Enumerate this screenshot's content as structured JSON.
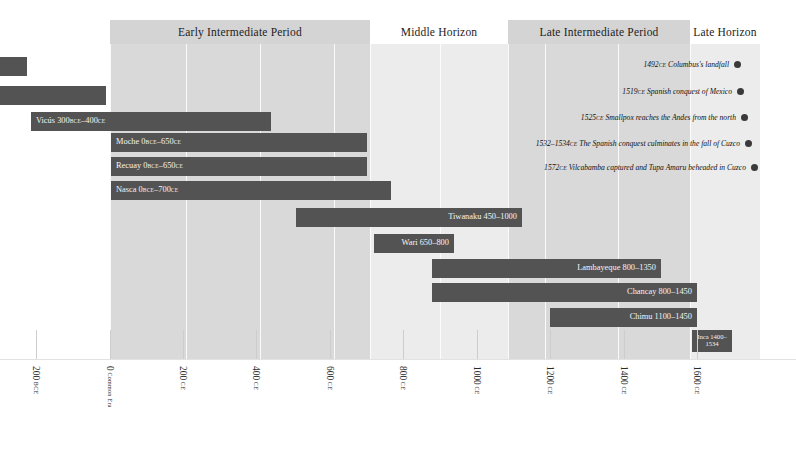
{
  "chart_data": {
    "type": "bar",
    "xlabel": "",
    "ylabel": "",
    "xlim": [
      -300,
      1650
    ],
    "grid": true,
    "legend": false,
    "orientation": "horizontal-gantt",
    "categories": [
      "",
      "",
      "Vicús",
      "Moche",
      "Recuay",
      "Nasca",
      "Tiwanaku",
      "Wari",
      "Lambayeque",
      "Chancay",
      "Chimu",
      "Inca"
    ],
    "series": [
      {
        "name": "cultures",
        "values": [
          {
            "label": "",
            "start": -300,
            "end": -230
          },
          {
            "label": "",
            "start": -300,
            "end": -10
          },
          {
            "label": "Vicús  300BCE–400CE",
            "start": -230,
            "end": 400
          },
          {
            "label": "Moche  0BCE–650CE",
            "start": 0,
            "end": 650
          },
          {
            "label": "Recuay  0BCE–650CE",
            "start": 0,
            "end": 650
          },
          {
            "label": "Nasca  0BCE–700CE",
            "start": 0,
            "end": 700
          },
          {
            "label": "Tiwanaku 450–1000",
            "start": 450,
            "end": 1000
          },
          {
            "label": "Wari 650–800",
            "start": 650,
            "end": 800
          },
          {
            "label": "Lambayeque 800–1350",
            "start": 800,
            "end": 1350
          },
          {
            "label": "Chancay 800–1450",
            "start": 800,
            "end": 1450
          },
          {
            "label": "Chimu 1100–1450",
            "start": 1100,
            "end": 1450
          },
          {
            "label": "Inca 1400–1534",
            "start": 1400,
            "end": 1534
          }
        ]
      }
    ],
    "annotations": [
      {
        "year": 1492,
        "text": "1492CE Columbus's landfall"
      },
      {
        "year": 1519,
        "text": "1519CE Spanish conquest of Mexico"
      },
      {
        "year": 1525,
        "text": "1525CE Smallpox reaches the Andes from the north"
      },
      {
        "year": 1533,
        "text": "1532–1534CE The Spanish conquest culminates in the fall of Cuzco"
      },
      {
        "year": 1572,
        "text": "1572CE Vilcabamba captured and Tupa Amaru beheaded in Cuzco"
      }
    ],
    "tick_values": [
      -200,
      0,
      200,
      400,
      600,
      800,
      1000,
      1200,
      1400,
      1600
    ],
    "tick_labels": [
      "200 BCE",
      "0 Common Era",
      "200 CE",
      "400 CE",
      "600 CE",
      "800 CE",
      "1000 CE",
      "1200 CE",
      "1400 CE",
      "1600 CE"
    ]
  },
  "colors": {
    "bar": "#535353",
    "band_shaded": "#d9d9d9",
    "band_light": "#ececec",
    "band_plain": "#f2f2f2",
    "header_shaded": "#d4d4d4",
    "dot": "#3a3a3a",
    "bar_text": "#f3f3f3"
  },
  "periods": [
    {
      "name": "Early Intermediate Period",
      "x": 110,
      "w": 260,
      "style": "shaded"
    },
    {
      "name": "Middle Horizon",
      "x": 370,
      "w": 138,
      "style": "plain"
    },
    {
      "name": "Late Intermediate Period",
      "x": 508,
      "w": 182,
      "style": "shaded"
    },
    {
      "name": "Late Horizon",
      "x": 690,
      "w": 70,
      "style": "plain"
    }
  ],
  "bars": [
    {
      "name": "bar-row-1",
      "label": "",
      "x": 0,
      "w": 27,
      "y": 57,
      "align": "lft",
      "lines": 1
    },
    {
      "name": "bar-row-2",
      "label": "",
      "x": 0,
      "w": 106,
      "y": 86,
      "align": "lft",
      "lines": 1
    },
    {
      "name": "bar-vicus",
      "label": "Vicús  300BCE–400CE",
      "x": 31,
      "w": 240,
      "y": 112,
      "align": "lft",
      "lines": 1
    },
    {
      "name": "bar-moche",
      "label": "Moche  0BCE–650CE",
      "x": 111,
      "w": 256,
      "y": 133,
      "align": "lft",
      "lines": 1
    },
    {
      "name": "bar-recuay",
      "label": "Recuay  0BCE–650CE",
      "x": 111,
      "w": 256,
      "y": 157,
      "align": "lft",
      "lines": 1
    },
    {
      "name": "bar-nasca",
      "label": "Nasca  0BCE–700CE",
      "x": 111,
      "w": 280,
      "y": 181,
      "align": "lft",
      "lines": 1
    },
    {
      "name": "bar-tiwanaku",
      "label": "Tiwanaku 450–1000",
      "x": 296,
      "w": 226,
      "y": 208,
      "align": "rgt",
      "lines": 1
    },
    {
      "name": "bar-wari",
      "label": "Wari 650–800",
      "x": 374,
      "w": 80,
      "y": 234,
      "align": "rgt",
      "lines": 1
    },
    {
      "name": "bar-lambayeque",
      "label": "Lambayeque 800–1350",
      "x": 432,
      "w": 229,
      "y": 259,
      "align": "rgt",
      "lines": 1
    },
    {
      "name": "bar-chancay",
      "label": "Chancay 800–1450",
      "x": 432,
      "w": 265,
      "y": 283,
      "align": "rgt",
      "lines": 1
    },
    {
      "name": "bar-chimu",
      "label": "Chimu 1100–1450",
      "x": 550,
      "w": 147,
      "y": 308,
      "align": "rgt",
      "lines": 1
    },
    {
      "name": "bar-inca",
      "label": "Inca 1400–1534",
      "x": 692,
      "w": 40,
      "y": 330,
      "align": "ctr",
      "lines": 2
    }
  ],
  "events": [
    {
      "name": "event-columbus",
      "text": "1492CE Columbus's landfall",
      "right": 55,
      "y": 58
    },
    {
      "name": "event-mexico",
      "text": "1519CE Spanish conquest of Mexico",
      "right": 52,
      "y": 85
    },
    {
      "name": "event-smallpox",
      "text": "1525CE Smallpox reaches the Andes from the north",
      "right": 48,
      "y": 111
    },
    {
      "name": "event-cuzco",
      "text": "1532–1534CE The Spanish conquest culminates in the fall of Cuzco",
      "right": 44,
      "y": 137
    },
    {
      "name": "event-vilcabamba",
      "text": "1572CE Vilcabamba captured and Tupa Amaru beheaded in Cuzco",
      "right": 38,
      "y": 161
    }
  ],
  "gridlines": [
    110,
    186,
    260,
    334,
    370,
    440,
    508,
    545,
    618,
    690,
    760
  ],
  "axis": {
    "ticks": [
      {
        "x": 36,
        "num": "200",
        "era": "BCE",
        "name": "tick-200-bce"
      },
      {
        "x": 110,
        "num": "0",
        "era": "Common Era",
        "name": "tick-0-ce"
      },
      {
        "x": 183,
        "num": "200",
        "era": "CE",
        "name": "tick-200-ce"
      },
      {
        "x": 256,
        "num": "400",
        "era": "CE",
        "name": "tick-400-ce"
      },
      {
        "x": 330,
        "num": "600",
        "era": "CE",
        "name": "tick-600-ce"
      },
      {
        "x": 403,
        "num": "800",
        "era": "CE",
        "name": "tick-800-ce"
      },
      {
        "x": 477,
        "num": "1000",
        "era": "CE",
        "name": "tick-1000-ce"
      },
      {
        "x": 550,
        "num": "1200",
        "era": "CE",
        "name": "tick-1200-ce"
      },
      {
        "x": 624,
        "num": "1400",
        "era": "CE",
        "name": "tick-1400-ce"
      },
      {
        "x": 697,
        "num": "1600",
        "era": "CE",
        "name": "tick-1600-ce"
      }
    ]
  }
}
